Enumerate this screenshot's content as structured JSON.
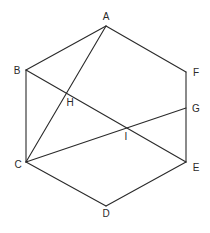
{
  "diagram": {
    "type": "geometry",
    "stroke_color": "#2a2a2a",
    "background": "#ffffff",
    "points": {
      "A": {
        "label": "A",
        "x": 106,
        "y": 26
      },
      "B": {
        "label": "B",
        "x": 26,
        "y": 70
      },
      "C": {
        "label": "C",
        "x": 26,
        "y": 162
      },
      "D": {
        "label": "D",
        "x": 106,
        "y": 206
      },
      "E": {
        "label": "E",
        "x": 186,
        "y": 162
      },
      "F": {
        "label": "F",
        "x": 186,
        "y": 72
      },
      "G": {
        "label": "G",
        "x": 186,
        "y": 108
      },
      "H": {
        "label": "H",
        "x": 67,
        "y": 93
      },
      "I": {
        "label": "I",
        "x": 126,
        "y": 127
      }
    },
    "segments": [
      [
        "A",
        "B"
      ],
      [
        "B",
        "C"
      ],
      [
        "C",
        "D"
      ],
      [
        "D",
        "E"
      ],
      [
        "E",
        "F"
      ],
      [
        "F",
        "A"
      ],
      [
        "A",
        "C"
      ],
      [
        "B",
        "E"
      ],
      [
        "C",
        "G"
      ]
    ],
    "labels": {
      "A": "A",
      "B": "B",
      "C": "C",
      "D": "D",
      "E": "E",
      "F": "F",
      "G": "G",
      "H": "H",
      "I": "I"
    }
  }
}
